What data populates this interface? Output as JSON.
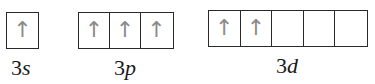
{
  "diagram": {
    "type": "orbital-box-diagram",
    "subshells": [
      {
        "id": "3s",
        "n": "3",
        "l": "s",
        "orbitals": [
          "up"
        ]
      },
      {
        "id": "3p",
        "n": "3",
        "l": "p",
        "orbitals": [
          "up",
          "up",
          "up"
        ]
      },
      {
        "id": "3d",
        "n": "3",
        "l": "d",
        "orbitals": [
          "up",
          "up",
          "",
          "",
          ""
        ]
      }
    ],
    "arrow_glyph": "↑",
    "colors": {
      "box_border": "#2a2a2a",
      "arrow": "#8a8a8a",
      "label": "#1a1a1a"
    }
  }
}
